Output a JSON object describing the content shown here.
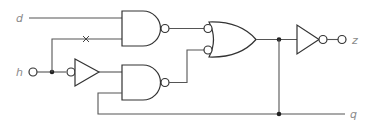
{
  "diagram": {
    "type": "logic-circuit",
    "labels": {
      "input_d": "d",
      "input_h": "h",
      "output_z": "z",
      "output_q": "q"
    },
    "components": [
      {
        "id": "buffer-inverted-input",
        "kind": "buffer with inverted input",
        "input": "h",
        "output": "clk_b"
      },
      {
        "id": "nand-1",
        "kind": "NAND",
        "inputs": [
          "d",
          "h"
        ],
        "output": "n1"
      },
      {
        "id": "nand-2",
        "kind": "NAND",
        "inputs": [
          "clk_b",
          "q"
        ],
        "output": "n2"
      },
      {
        "id": "or-1",
        "kind": "OR with inverted inputs",
        "inputs": [
          "n1",
          "n2"
        ],
        "output": "q"
      },
      {
        "id": "inverter-out",
        "kind": "NOT",
        "input": "q",
        "output": "z"
      }
    ],
    "annotations": {
      "crossing_mark": "x"
    },
    "colors": {
      "wire": "#555555",
      "gate_stroke": "#333333",
      "label": "#8a8a8a",
      "background": "#ffffff"
    }
  }
}
